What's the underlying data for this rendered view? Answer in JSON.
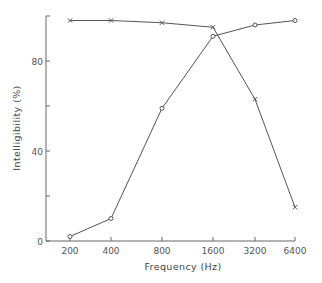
{
  "chart_data": {
    "type": "line",
    "title": "",
    "xlabel": "Frequency (Hz)",
    "ylabel": "Intelligibility (%)",
    "categories": [
      "200",
      "400",
      "800",
      "1600",
      "3200",
      "6400"
    ],
    "x_scale": "log2",
    "ylim": [
      0,
      100
    ],
    "yticks": [
      0,
      20,
      40,
      60,
      80,
      100
    ],
    "ytick_labels": [
      "0",
      "",
      "40",
      "",
      "80",
      ""
    ],
    "grid": false,
    "legend": null,
    "series": [
      {
        "name": "Low-pass (x markers)",
        "marker": "x",
        "values": [
          98,
          98,
          97,
          95,
          63,
          15
        ]
      },
      {
        "name": "High-pass (o markers)",
        "marker": "o",
        "values": [
          2,
          10,
          59,
          91,
          96,
          98
        ]
      }
    ]
  },
  "colors": {
    "line": "#555555",
    "axis": "#666666",
    "text": "#555555"
  }
}
